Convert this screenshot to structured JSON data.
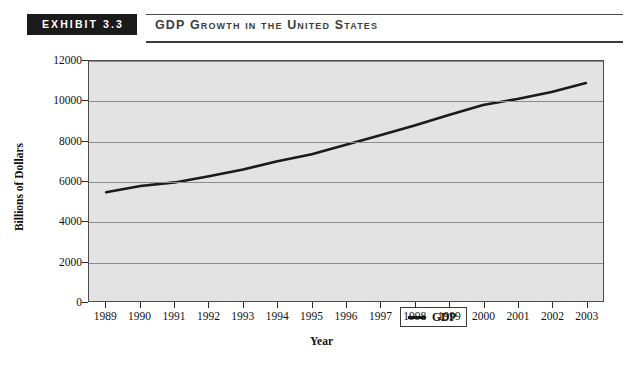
{
  "header": {
    "badge": "EXHIBIT 3.3",
    "title": "GDP Growth in the United States"
  },
  "chart_data": {
    "type": "line",
    "title": "GDP Growth in the United States",
    "xlabel": "Year",
    "ylabel": "Billions of Dollars",
    "categories": [
      "1989",
      "1990",
      "1991",
      "1992",
      "1993",
      "1994",
      "1995",
      "1996",
      "1997",
      "1998",
      "1999",
      "2000",
      "2001",
      "2002",
      "2003"
    ],
    "x_tick_labels": [
      "1989",
      "1990",
      "1991",
      "1992",
      "1993",
      "1994",
      "1995",
      "1996",
      "1997",
      "1998",
      "1999",
      "2000",
      "2001",
      "2002",
      "2003"
    ],
    "y_tick_labels": [
      "0",
      "2000",
      "4000",
      "6000",
      "8000",
      "10000",
      "12000"
    ],
    "y_ticks": [
      0,
      2000,
      4000,
      6000,
      8000,
      10000,
      12000
    ],
    "ylim": [
      0,
      12000
    ],
    "grid": true,
    "legend_position": "inside-bottom-center",
    "series": [
      {
        "name": "GDP",
        "color": "#1a1a1a",
        "values": [
          5440,
          5750,
          5930,
          6240,
          6580,
          6990,
          7340,
          7810,
          8290,
          8780,
          9300,
          9800,
          10100,
          10450,
          10900
        ]
      }
    ],
    "legend": [
      "GDP"
    ],
    "plot_background": "#e3e3e3",
    "gridline_color": "#8c8c8c"
  }
}
